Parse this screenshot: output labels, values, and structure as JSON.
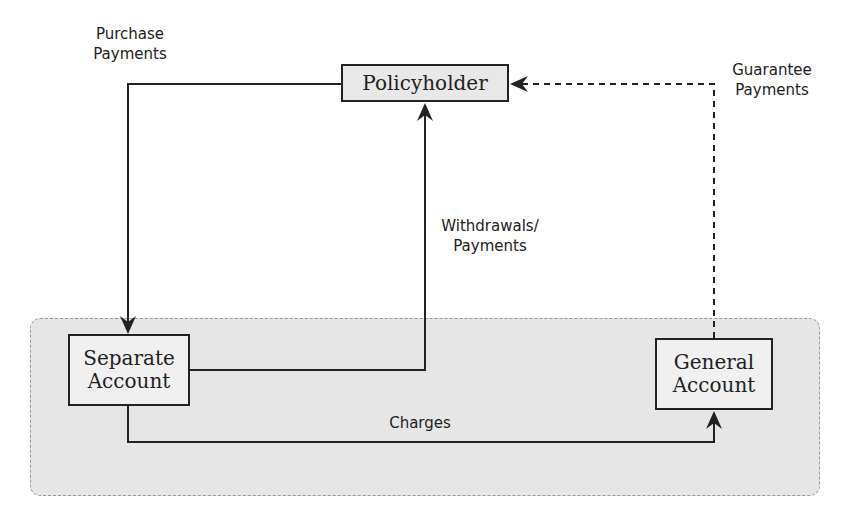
{
  "diagram": {
    "nodes": {
      "policyholder": "Policyholder",
      "separate_account_line1": "Separate",
      "separate_account_line2": "Account",
      "general_account_line1": "General",
      "general_account_line2": "Account"
    },
    "edges": {
      "purchase_line1": "Purchase",
      "purchase_line2": "Payments",
      "withdrawals_line1": "Withdrawals/",
      "withdrawals_line2": "Payments",
      "guarantee_line1": "Guarantee",
      "guarantee_line2": "Payments",
      "charges": "Charges"
    },
    "colors": {
      "region_fill": "#e6e6e6",
      "node_fill": "#ececec",
      "line": "#222222"
    }
  }
}
